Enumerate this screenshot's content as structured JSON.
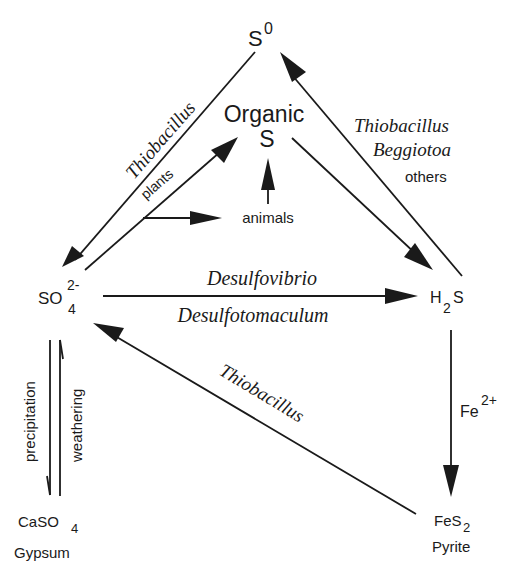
{
  "nodes": {
    "s0": {
      "base": "S",
      "sup": "0"
    },
    "organic": {
      "line1": "Organic",
      "line2": "S"
    },
    "sulfate": {
      "base": "SO",
      "sub": "4",
      "sup": "2-"
    },
    "h2s": {
      "base1": "H",
      "sub": "2",
      "base2": "S"
    },
    "gypsum": {
      "base": "CaSO",
      "sub": "4",
      "name": "Gypsum"
    },
    "pyrite": {
      "base": "FeS",
      "sub": "2",
      "name": "Pyrite"
    },
    "animals": "animals"
  },
  "edges": {
    "s0_to_sulfate": {
      "label": "Thiobacillus"
    },
    "sulfate_to_organic": {
      "label": "plants"
    },
    "plants_to_animals": {
      "label": ""
    },
    "animals_to_organic": {
      "label": ""
    },
    "organic_to_h2s": {
      "label": ""
    },
    "h2s_to_s0": {
      "label1": "Thiobacillus",
      "label2": "Beggiotoa",
      "label3": "others"
    },
    "sulfate_to_h2s": {
      "label_top": "Desulfovibrio",
      "label_bottom": "Desulfotomaculum"
    },
    "pyrite_to_sulfate": {
      "label": "Thiobacillus"
    },
    "h2s_to_pyrite": {
      "label_base": "Fe",
      "label_sup": "2+"
    },
    "sulfate_to_gypsum": {
      "label": "precipitation"
    },
    "gypsum_to_sulfate": {
      "label": "weathering"
    }
  },
  "colors": {
    "ink": "#1a1a1a",
    "background": "#ffffff"
  }
}
